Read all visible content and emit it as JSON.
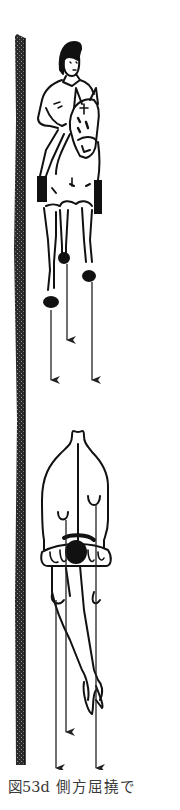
{
  "figure": {
    "type": "illustration",
    "wall": {
      "side": "left",
      "texture": "hatched"
    },
    "front_view": {
      "tracks": 3,
      "arrow_direction": "down"
    },
    "top_view": {
      "tracks": 3,
      "arrow_direction": "down"
    },
    "colors": {
      "ink": "#111111",
      "wall": "#3a3a3a",
      "background": "#ffffff"
    }
  },
  "caption": {
    "number": "図53d",
    "text": "側方屈撓で"
  }
}
